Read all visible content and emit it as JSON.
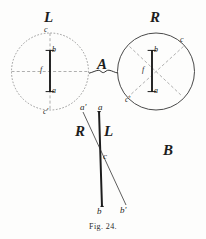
{
  "figure": {
    "caption": "Fig. 24.",
    "panels": [
      {
        "id": "A",
        "label": "A"
      },
      {
        "id": "B",
        "label": "B"
      }
    ],
    "colors": {
      "ink": "#1d1d1d",
      "dashed": "#8a8a8a",
      "paper": "#fdfdfc"
    },
    "panel_a": {
      "label": "A",
      "left_circle": {
        "title": "L",
        "needle_top": "b",
        "needle_bottom": "a",
        "pivot": "f",
        "axis_top": "c",
        "axis_bottom": "c'"
      },
      "right_circle": {
        "title": "R",
        "needle_top": "b",
        "needle_bottom": "a",
        "pivot": "f",
        "axis_top": "c",
        "axis_bottom": "c'"
      }
    },
    "panel_b": {
      "label": "B",
      "line_left_label": "R",
      "line_right_label": "L",
      "top_left": "a'",
      "top_right": "a",
      "crossing": "c",
      "bottom_left": "b",
      "bottom_right": "b'"
    }
  }
}
